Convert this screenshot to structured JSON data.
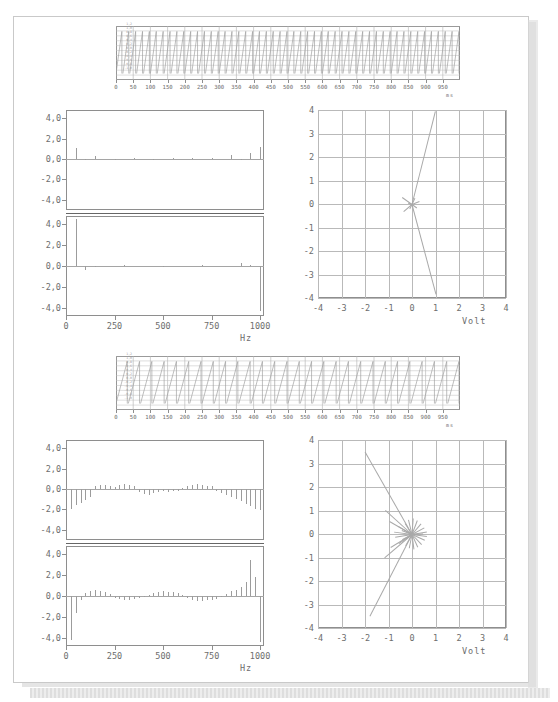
{
  "page": {
    "kind": "scanned-document-page",
    "background": "#ffffff",
    "sheet_border": "#c9c9c9"
  },
  "chart_data": [
    {
      "id": "strip-chart-top",
      "type": "line",
      "title": "",
      "xlabel": "ms",
      "ylabel": "",
      "xlim": [
        0,
        1000
      ],
      "xticks": [
        0,
        50,
        100,
        150,
        200,
        250,
        300,
        350,
        400,
        450,
        500,
        550,
        600,
        650,
        700,
        750,
        800,
        850,
        900,
        950
      ],
      "xticklabels": [
        "0",
        "50",
        "100",
        "150",
        "200",
        "250",
        "300",
        "350",
        "400",
        "450",
        "500",
        "550",
        "600",
        "650",
        "700",
        "750",
        "800",
        "850",
        "900",
        "950"
      ],
      "grid": true,
      "waveform": "sawtooth",
      "cycles": 50,
      "ylim": [
        -1.0,
        1.2
      ],
      "yticklabels": [
        "1,2",
        "1,0",
        "0,8",
        "0,6",
        "0,4",
        "0,2",
        "0,0",
        "-0,2",
        "-0,4",
        "-0,6",
        "-0,8",
        "-1,0"
      ],
      "series": [
        {
          "name": "signal",
          "trace": "periodic-sawtooth-with-spikes"
        }
      ]
    },
    {
      "id": "spectrum-top-left",
      "type": "bar",
      "title": "",
      "xlabel": "Hz",
      "ylabel": "",
      "xlim": [
        0,
        1020
      ],
      "xticks": [
        0,
        250,
        500,
        750,
        1000
      ],
      "xticklabels": [
        "0",
        "250",
        "500",
        "750",
        "1000"
      ],
      "panels": [
        {
          "name": "upper",
          "ylim": [
            -5.0,
            4.8
          ],
          "yticks": [
            4.0,
            2.0,
            0.0,
            -2.0,
            -4.0
          ],
          "yticklabels": [
            "4,0",
            "2,0",
            "0,0",
            "-2,0",
            "-4,0"
          ],
          "x": [
            50,
            100,
            150,
            250,
            350,
            450,
            550,
            650,
            750,
            850,
            900,
            950,
            1000
          ],
          "values": [
            1.05,
            -0.12,
            0.28,
            -0.08,
            0.06,
            -0.05,
            0.06,
            0.08,
            0.12,
            0.38,
            -0.14,
            0.55,
            1.15
          ]
        },
        {
          "name": "lower",
          "ylim": [
            -4.8,
            4.8
          ],
          "yticks": [
            4.0,
            2.0,
            0.0,
            -2.0,
            -4.0
          ],
          "yticklabels": [
            "4,0",
            "2,0",
            "0,0",
            "-2,0",
            "-4,0"
          ],
          "x": [
            50,
            100,
            150,
            300,
            500,
            700,
            900,
            950,
            1000
          ],
          "values": [
            4.55,
            -0.35,
            -0.08,
            0.05,
            0.04,
            0.05,
            0.3,
            0.1,
            -4.35
          ]
        }
      ]
    },
    {
      "id": "phasor-top-right",
      "type": "scatter",
      "title": "",
      "xlabel": "Volt",
      "ylabel": "",
      "xlim": [
        -4,
        4
      ],
      "ylim": [
        -4,
        4
      ],
      "xticks": [
        -4,
        -3,
        -2,
        -1,
        0,
        1,
        2,
        3,
        4
      ],
      "yticks": [
        -4,
        -3,
        -2,
        -1,
        0,
        1,
        2,
        3,
        4
      ],
      "xticklabels": [
        "-4",
        "-3",
        "-2",
        "-1",
        "0",
        "1",
        "2",
        "3",
        "4"
      ],
      "yticklabels": [
        "-4",
        "-3",
        "-2",
        "-1",
        "0",
        "1",
        "2",
        "3",
        "4"
      ],
      "grid": true,
      "plot_style": "vectors-from-origin",
      "vectors": [
        {
          "x": 1.0,
          "y": 3.98
        },
        {
          "x": 1.02,
          "y": -3.82
        },
        {
          "x": -0.42,
          "y": 0.3
        },
        {
          "x": -0.35,
          "y": -0.3
        },
        {
          "x": 0.3,
          "y": 0.12
        },
        {
          "x": 0.22,
          "y": -0.16
        },
        {
          "x": -0.18,
          "y": 0.06
        },
        {
          "x": 0.12,
          "y": 0.26
        },
        {
          "x": -0.1,
          "y": -0.2
        }
      ]
    },
    {
      "id": "strip-chart-bottom",
      "type": "line",
      "title": "",
      "xlabel": "ms",
      "ylabel": "",
      "xlim": [
        0,
        1000
      ],
      "xticks": [
        0,
        50,
        100,
        150,
        200,
        250,
        300,
        350,
        400,
        450,
        500,
        550,
        600,
        650,
        700,
        750,
        800,
        850,
        900,
        950
      ],
      "xticklabels": [
        "0",
        "50",
        "100",
        "150",
        "200",
        "250",
        "300",
        "350",
        "400",
        "450",
        "500",
        "550",
        "600",
        "650",
        "700",
        "750",
        "800",
        "850",
        "900",
        "950"
      ],
      "grid": true,
      "waveform": "sawtooth-dense",
      "cycles": 28,
      "ylim": [
        -1.0,
        1.2
      ],
      "yticklabels": [
        "1,2",
        "1,0",
        "0,8",
        "0,6",
        "0,4",
        "0,2",
        "0,0",
        "-0,2",
        "-0,4",
        "-0,6",
        "-0,8",
        "-1,0"
      ],
      "series": [
        {
          "name": "signal",
          "trace": "ramp-sawtooth"
        }
      ]
    },
    {
      "id": "spectrum-bottom-left",
      "type": "bar",
      "title": "",
      "xlabel": "Hz",
      "ylabel": "",
      "xlim": [
        0,
        1020
      ],
      "xticks": [
        0,
        250,
        500,
        750,
        1000
      ],
      "xticklabels": [
        "0",
        "250",
        "500",
        "750",
        "1000"
      ],
      "panels": [
        {
          "name": "upper",
          "ylim": [
            -5.0,
            4.8
          ],
          "yticks": [
            4.0,
            2.0,
            0.0,
            -2.0,
            -4.0
          ],
          "yticklabels": [
            "4,0",
            "2,0",
            "0,0",
            "-2,0",
            "-4,0"
          ],
          "x": [
            25,
            50,
            75,
            100,
            125,
            150,
            175,
            200,
            225,
            250,
            275,
            300,
            325,
            350,
            375,
            400,
            425,
            450,
            475,
            500,
            525,
            550,
            575,
            600,
            625,
            650,
            675,
            700,
            725,
            750,
            775,
            800,
            825,
            850,
            875,
            900,
            925,
            950,
            975,
            1000
          ],
          "values": [
            -1.95,
            -1.55,
            -1.35,
            -1.05,
            -0.75,
            0.3,
            0.42,
            0.4,
            0.34,
            0.2,
            0.42,
            0.46,
            0.4,
            0.34,
            -0.3,
            -0.45,
            -0.55,
            -0.42,
            -0.3,
            -0.2,
            -0.3,
            -0.24,
            -0.18,
            0.1,
            0.34,
            0.42,
            0.46,
            0.4,
            0.34,
            0.26,
            -0.2,
            -0.42,
            -0.58,
            -0.75,
            -1.0,
            -1.2,
            -1.45,
            -1.7,
            -1.95,
            -2.05
          ]
        },
        {
          "name": "lower",
          "ylim": [
            -4.8,
            4.8
          ],
          "yticks": [
            4.0,
            2.0,
            0.0,
            -2.0,
            -4.0
          ],
          "yticklabels": [
            "4,0",
            "2,0",
            "0,0",
            "-2,0",
            "-4,0"
          ],
          "x": [
            25,
            50,
            75,
            100,
            125,
            150,
            175,
            200,
            225,
            250,
            275,
            300,
            325,
            350,
            375,
            400,
            425,
            450,
            475,
            500,
            525,
            550,
            575,
            600,
            625,
            650,
            675,
            700,
            725,
            750,
            775,
            800,
            825,
            850,
            875,
            900,
            925,
            950,
            975,
            1000
          ],
          "values": [
            -4.2,
            -1.65,
            -0.4,
            0.32,
            0.48,
            0.55,
            0.52,
            0.4,
            0.15,
            -0.18,
            -0.3,
            -0.38,
            -0.34,
            -0.26,
            -0.16,
            -0.1,
            0.08,
            0.3,
            0.4,
            0.46,
            0.42,
            0.36,
            0.26,
            0.12,
            -0.2,
            -0.38,
            -0.5,
            -0.46,
            -0.4,
            -0.34,
            -0.24,
            -0.14,
            0.2,
            0.45,
            0.6,
            0.9,
            1.3,
            3.45,
            1.85,
            -4.4
          ]
        }
      ]
    },
    {
      "id": "phasor-bottom-right",
      "type": "scatter",
      "title": "",
      "xlabel": "Volt",
      "ylabel": "",
      "xlim": [
        -4,
        4
      ],
      "ylim": [
        -4,
        4
      ],
      "xticks": [
        -4,
        -3,
        -2,
        -1,
        0,
        1,
        2,
        3,
        4
      ],
      "yticks": [
        -4,
        -3,
        -2,
        -1,
        0,
        1,
        2,
        3,
        4
      ],
      "xticklabels": [
        "-4",
        "-3",
        "-2",
        "-1",
        "0",
        "1",
        "2",
        "3",
        "4"
      ],
      "yticklabels": [
        "-4",
        "-3",
        "-2",
        "-1",
        "0",
        "1",
        "2",
        "3",
        "4"
      ],
      "grid": true,
      "plot_style": "vectors-from-origin",
      "vectors": [
        {
          "x": -2.0,
          "y": 3.52
        },
        {
          "x": -1.8,
          "y": -3.5
        },
        {
          "x": -1.12,
          "y": 1.02
        },
        {
          "x": -1.15,
          "y": -0.98
        },
        {
          "x": -0.75,
          "y": 0.1
        },
        {
          "x": -0.72,
          "y": -0.12
        },
        {
          "x": -0.6,
          "y": 0.35
        },
        {
          "x": -0.55,
          "y": -0.38
        },
        {
          "x": -0.45,
          "y": 0.18
        },
        {
          "x": -0.42,
          "y": -0.22
        },
        {
          "x": -0.3,
          "y": 0.48
        },
        {
          "x": -0.28,
          "y": -0.5
        },
        {
          "x": -0.15,
          "y": 0.62
        },
        {
          "x": -0.12,
          "y": -0.6
        },
        {
          "x": 0.05,
          "y": 0.66
        },
        {
          "x": 0.08,
          "y": -0.62
        },
        {
          "x": 0.22,
          "y": 0.58
        },
        {
          "x": 0.25,
          "y": -0.55
        },
        {
          "x": 0.38,
          "y": 0.45
        },
        {
          "x": 0.4,
          "y": -0.42
        },
        {
          "x": 0.52,
          "y": 0.28
        },
        {
          "x": 0.55,
          "y": -0.25
        },
        {
          "x": 0.62,
          "y": 0.1
        },
        {
          "x": 0.62,
          "y": -0.08
        },
        {
          "x": 0.48,
          "y": 0.02
        },
        {
          "x": -0.95,
          "y": 0.55
        },
        {
          "x": -0.9,
          "y": -0.55
        }
      ]
    }
  ],
  "labels": {
    "hz": "Hz",
    "volt": "Volt",
    "ms": "ms"
  }
}
